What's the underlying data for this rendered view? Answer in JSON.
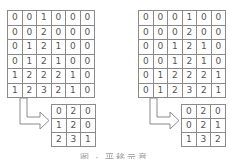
{
  "diagram": {
    "left": {
      "input_grid": [
        [
          0,
          0,
          1,
          0,
          0,
          0
        ],
        [
          0,
          0,
          2,
          0,
          0,
          0
        ],
        [
          0,
          1,
          2,
          1,
          0,
          0
        ],
        [
          0,
          1,
          2,
          1,
          0,
          0
        ],
        [
          1,
          2,
          2,
          2,
          1,
          0
        ],
        [
          1,
          2,
          3,
          2,
          1,
          0
        ]
      ],
      "output_grid": [
        [
          0,
          2,
          0
        ],
        [
          1,
          2,
          0
        ],
        [
          2,
          3,
          1
        ]
      ]
    },
    "right": {
      "input_grid": [
        [
          0,
          0,
          0,
          1,
          0,
          0
        ],
        [
          0,
          0,
          0,
          2,
          0,
          0
        ],
        [
          0,
          0,
          1,
          2,
          1,
          0
        ],
        [
          0,
          0,
          1,
          2,
          1,
          0
        ],
        [
          0,
          1,
          2,
          2,
          2,
          1
        ],
        [
          0,
          1,
          2,
          3,
          2,
          1
        ]
      ],
      "output_grid": [
        [
          0,
          2,
          0
        ],
        [
          0,
          2,
          1
        ],
        [
          1,
          3,
          2
        ]
      ]
    },
    "arrow_icon": "l-shaped-right-arrow",
    "caption": "图 · 平移示意"
  },
  "colors": {
    "border": "#8a8a8a",
    "text": "#555555",
    "background": "#ffffff"
  }
}
